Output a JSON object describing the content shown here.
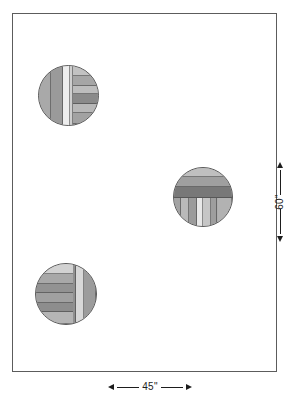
{
  "figure": {
    "background_color": "#ffffff",
    "outline_color": "#5c5c5c"
  },
  "plan": {
    "name": "plan-rectangle",
    "x": 12,
    "y": 13,
    "width": 265,
    "height": 359,
    "fill": "#ffffff"
  },
  "dimensions": {
    "horizontal": {
      "label": "45\"",
      "value": 45,
      "unit": "inch",
      "position": "bottom",
      "left_arrow": "arrow-left",
      "right_arrow": "arrow-right"
    },
    "vertical": {
      "label": "60\"",
      "value": 60,
      "unit": "inch",
      "position": "right",
      "top_arrow": "arrow-up",
      "bottom_arrow": "arrow-down"
    }
  },
  "circles": [
    {
      "name": "circle-top-left",
      "cx": 68,
      "cy": 95,
      "diameter": 61,
      "base_fill": "#b0b0b0",
      "stroke": "#5a5a5a",
      "bands": [
        {
          "orientation": "vertical",
          "start_pct": 0,
          "size_pct": 22,
          "fill": "#a9a9a9"
        },
        {
          "orientation": "vertical",
          "start_pct": 22,
          "size_pct": 20,
          "fill": "#9a9a9a"
        },
        {
          "orientation": "vertical",
          "start_pct": 42,
          "size_pct": 12,
          "fill": "#ededed"
        },
        {
          "orientation": "vertical",
          "start_pct": 54,
          "size_pct": 4,
          "fill": "#cfcfcf"
        },
        {
          "orientation": "horizontal",
          "start_pct": 0,
          "size_pct": 18,
          "fill": "#c2c2c2",
          "from_pct": 58
        },
        {
          "orientation": "horizontal",
          "start_pct": 18,
          "size_pct": 16,
          "fill": "#a6a6a6",
          "from_pct": 58
        },
        {
          "orientation": "horizontal",
          "start_pct": 34,
          "size_pct": 15,
          "fill": "#bdbdbd",
          "from_pct": 58
        },
        {
          "orientation": "horizontal",
          "start_pct": 49,
          "size_pct": 17,
          "fill": "#8a8a8a",
          "from_pct": 58
        },
        {
          "orientation": "horizontal",
          "start_pct": 66,
          "size_pct": 14,
          "fill": "#b8b8b8",
          "from_pct": 58
        },
        {
          "orientation": "horizontal",
          "start_pct": 80,
          "size_pct": 20,
          "fill": "#a2a2a2",
          "from_pct": 58
        }
      ]
    },
    {
      "name": "circle-middle-right",
      "cx": 203,
      "cy": 197,
      "diameter": 60,
      "base_fill": "#aeaeae",
      "stroke": "#5a5a5a",
      "bands": [
        {
          "orientation": "horizontal",
          "start_pct": 0,
          "size_pct": 16,
          "fill": "#bfbfbf"
        },
        {
          "orientation": "horizontal",
          "start_pct": 16,
          "size_pct": 17,
          "fill": "#9f9f9f"
        },
        {
          "orientation": "horizontal",
          "start_pct": 33,
          "size_pct": 18,
          "fill": "#787878"
        },
        {
          "orientation": "vertical",
          "start_pct": 0,
          "size_pct": 12,
          "fill": "#a3a3a3",
          "from_pct": 51
        },
        {
          "orientation": "vertical",
          "start_pct": 12,
          "size_pct": 14,
          "fill": "#b9b9b9",
          "from_pct": 51
        },
        {
          "orientation": "vertical",
          "start_pct": 26,
          "size_pct": 13,
          "fill": "#9b9b9b",
          "from_pct": 51
        },
        {
          "orientation": "vertical",
          "start_pct": 39,
          "size_pct": 11,
          "fill": "#e8e8e8",
          "from_pct": 51
        },
        {
          "orientation": "vertical",
          "start_pct": 50,
          "size_pct": 13,
          "fill": "#c6c6c6",
          "from_pct": 51
        },
        {
          "orientation": "vertical",
          "start_pct": 63,
          "size_pct": 12,
          "fill": "#9e9e9e",
          "from_pct": 51
        },
        {
          "orientation": "vertical",
          "start_pct": 75,
          "size_pct": 25,
          "fill": "#b2b2b2",
          "from_pct": 51
        }
      ]
    },
    {
      "name": "circle-bottom-left",
      "cx": 66,
      "cy": 294,
      "diameter": 62,
      "base_fill": "#acacac",
      "stroke": "#5a5a5a",
      "bands": [
        {
          "orientation": "horizontal",
          "start_pct": 0,
          "size_pct": 17,
          "fill": "#d2d2d2",
          "to_pct": 62
        },
        {
          "orientation": "horizontal",
          "start_pct": 17,
          "size_pct": 16,
          "fill": "#a8a8a8",
          "to_pct": 62
        },
        {
          "orientation": "horizontal",
          "start_pct": 33,
          "size_pct": 16,
          "fill": "#929292",
          "to_pct": 62
        },
        {
          "orientation": "horizontal",
          "start_pct": 49,
          "size_pct": 16,
          "fill": "#a0a0a0",
          "to_pct": 62
        },
        {
          "orientation": "horizontal",
          "start_pct": 65,
          "size_pct": 15,
          "fill": "#8d8d8d",
          "to_pct": 62
        },
        {
          "orientation": "horizontal",
          "start_pct": 80,
          "size_pct": 20,
          "fill": "#b5b5b5",
          "to_pct": 62
        },
        {
          "orientation": "vertical",
          "start_pct": 62,
          "size_pct": 5,
          "fill": "#909090"
        },
        {
          "orientation": "vertical",
          "start_pct": 67,
          "size_pct": 13,
          "fill": "#d8d8d8"
        },
        {
          "orientation": "vertical",
          "start_pct": 80,
          "size_pct": 20,
          "fill": "#9c9c9c"
        }
      ]
    }
  ]
}
